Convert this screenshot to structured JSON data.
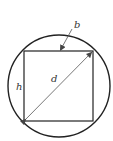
{
  "diagram": {
    "labels": {
      "b": "b",
      "d": "d",
      "h": "h"
    },
    "colors": {
      "stroke": "#222222",
      "arrow": "#555555",
      "background": "#ffffff"
    },
    "shapes": {
      "circle": {
        "cx": 59,
        "cy": 86,
        "r": 51
      },
      "rectangle": {
        "x1": 24,
        "y1": 51,
        "x2": 93,
        "y2": 121
      }
    }
  }
}
